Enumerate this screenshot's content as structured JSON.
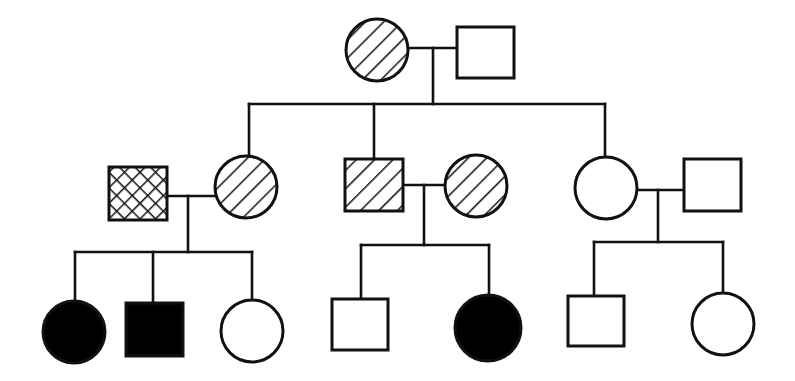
{
  "diagram": {
    "type": "pedigree-chart",
    "generations": 3,
    "colors": {
      "stroke": "#111111",
      "affected": "#000000",
      "background": "#ffffff"
    },
    "individuals": [
      {
        "id": "I-1",
        "generation": 1,
        "sex": "female",
        "shape": "circle",
        "fill": "diagonal-hatch",
        "cx": 377,
        "cy": 50,
        "r": 31
      },
      {
        "id": "I-2",
        "generation": 1,
        "sex": "male",
        "shape": "square",
        "fill": "none",
        "x": 457,
        "y": 27,
        "w": 57,
        "h": 51
      },
      {
        "id": "II-1",
        "generation": 2,
        "sex": "male",
        "shape": "square",
        "fill": "cross-hatch",
        "x": 109,
        "y": 167,
        "w": 58,
        "h": 53
      },
      {
        "id": "II-2",
        "generation": 2,
        "sex": "female",
        "shape": "circle",
        "fill": "diagonal-hatch",
        "cx": 246,
        "cy": 187,
        "r": 31
      },
      {
        "id": "II-3",
        "generation": 2,
        "sex": "male",
        "shape": "square",
        "fill": "diagonal-hatch",
        "x": 345,
        "y": 159,
        "w": 58,
        "h": 52
      },
      {
        "id": "II-4",
        "generation": 2,
        "sex": "female",
        "shape": "circle",
        "fill": "diagonal-hatch",
        "cx": 476,
        "cy": 186,
        "r": 31
      },
      {
        "id": "II-5",
        "generation": 2,
        "sex": "female",
        "shape": "circle",
        "fill": "none",
        "cx": 606,
        "cy": 188,
        "r": 31
      },
      {
        "id": "II-6",
        "generation": 2,
        "sex": "male",
        "shape": "square",
        "fill": "none",
        "x": 684,
        "y": 159,
        "w": 57,
        "h": 52
      },
      {
        "id": "III-1",
        "generation": 3,
        "sex": "female",
        "shape": "circle",
        "fill": "solid",
        "cx": 74,
        "cy": 332,
        "r": 31
      },
      {
        "id": "III-2",
        "generation": 3,
        "sex": "male",
        "shape": "square",
        "fill": "solid",
        "x": 126,
        "y": 303,
        "w": 57,
        "h": 53
      },
      {
        "id": "III-3",
        "generation": 3,
        "sex": "female",
        "shape": "circle",
        "fill": "none",
        "cx": 252,
        "cy": 331,
        "r": 31
      },
      {
        "id": "III-4",
        "generation": 3,
        "sex": "male",
        "shape": "square",
        "fill": "none",
        "x": 332,
        "y": 299,
        "w": 56,
        "h": 51
      },
      {
        "id": "III-5",
        "generation": 3,
        "sex": "female",
        "shape": "circle",
        "fill": "solid",
        "cx": 488,
        "cy": 328,
        "r": 33
      },
      {
        "id": "III-6",
        "generation": 3,
        "sex": "male",
        "shape": "square",
        "fill": "none",
        "x": 568,
        "y": 296,
        "w": 56,
        "h": 50
      },
      {
        "id": "III-7",
        "generation": 3,
        "sex": "female",
        "shape": "circle",
        "fill": "none",
        "cx": 723,
        "cy": 324,
        "r": 31
      }
    ],
    "couples": [
      {
        "id": "couple-I",
        "partners": [
          "I-1",
          "I-2"
        ],
        "line": [
          408,
          48,
          457,
          48
        ],
        "stem": [
          433,
          48,
          433,
          104
        ]
      },
      {
        "id": "couple-II-a",
        "partners": [
          "II-1",
          "II-2"
        ],
        "line": [
          167,
          196,
          215,
          196
        ],
        "stem": [
          188,
          196,
          188,
          252
        ]
      },
      {
        "id": "couple-II-b",
        "partners": [
          "II-3",
          "II-4"
        ],
        "line": [
          403,
          185,
          445,
          185
        ],
        "stem": [
          424,
          185,
          424,
          245
        ]
      },
      {
        "id": "couple-II-c",
        "partners": [
          "II-5",
          "II-6"
        ],
        "line": [
          637,
          190,
          684,
          190
        ],
        "stem": [
          658,
          190,
          658,
          242
        ]
      }
    ],
    "sibships": [
      {
        "id": "sibship-II",
        "parents": "couple-I",
        "bar": [
          249,
          104,
          605,
          104
        ],
        "drops": [
          [
            249,
            104,
            249,
            156
          ],
          [
            374,
            104,
            374,
            159
          ],
          [
            605,
            104,
            605,
            157
          ]
        ],
        "children": [
          "II-2",
          "II-3",
          "II-5"
        ]
      },
      {
        "id": "sibship-III-a",
        "parents": "couple-II-a",
        "bar": [
          75,
          252,
          252,
          252
        ],
        "drops": [
          [
            75,
            252,
            75,
            301
          ],
          [
            153,
            252,
            153,
            303
          ],
          [
            252,
            252,
            252,
            300
          ]
        ],
        "children": [
          "III-1",
          "III-2",
          "III-3"
        ]
      },
      {
        "id": "sibship-III-b",
        "parents": "couple-II-b",
        "bar": [
          361,
          245,
          489,
          245
        ],
        "drops": [
          [
            361,
            245,
            361,
            299
          ],
          [
            489,
            245,
            489,
            295
          ]
        ],
        "children": [
          "III-4",
          "III-5"
        ]
      },
      {
        "id": "sibship-III-c",
        "parents": "couple-II-c",
        "bar": [
          594,
          242,
          723,
          242
        ],
        "drops": [
          [
            594,
            242,
            594,
            296
          ],
          [
            723,
            242,
            723,
            293
          ]
        ],
        "children": [
          "III-6",
          "III-7"
        ]
      }
    ]
  }
}
